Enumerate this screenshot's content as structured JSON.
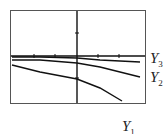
{
  "chart_data": {
    "type": "line",
    "title": "",
    "xlabel": "",
    "ylabel": "",
    "grid": false,
    "axes": {
      "x_axis_visible": true,
      "y_axis_visible": true,
      "tick_marks": true
    },
    "series": [
      {
        "name": "Y1",
        "label": "Y",
        "sub": "1",
        "description": "steepest decreasing curve, concave down",
        "points_px": [
          [
            12,
            65
          ],
          [
            40,
            72
          ],
          [
            77,
            79
          ],
          [
            100,
            88
          ],
          [
            122,
            101
          ]
        ]
      },
      {
        "name": "Y2",
        "label": "Y",
        "sub": "2",
        "description": "moderately decreasing line",
        "points_px": [
          [
            12,
            60
          ],
          [
            40,
            60
          ],
          [
            77,
            63
          ],
          [
            100,
            67
          ],
          [
            140,
            77
          ]
        ]
      },
      {
        "name": "Y3",
        "label": "Y",
        "sub": "3",
        "description": "nearly flat, slightly decreasing",
        "points_px": [
          [
            12,
            57
          ],
          [
            40,
            57
          ],
          [
            77,
            58
          ],
          [
            100,
            60
          ],
          [
            140,
            62
          ]
        ]
      }
    ],
    "legend": {
      "position": "right",
      "entries": [
        "Y3",
        "Y2",
        "Y1"
      ]
    }
  },
  "labels": {
    "y3": {
      "main": "Y",
      "sub": "3"
    },
    "y2": {
      "main": "Y",
      "sub": "2"
    },
    "y1": {
      "main": "Y",
      "sub": "1"
    }
  }
}
